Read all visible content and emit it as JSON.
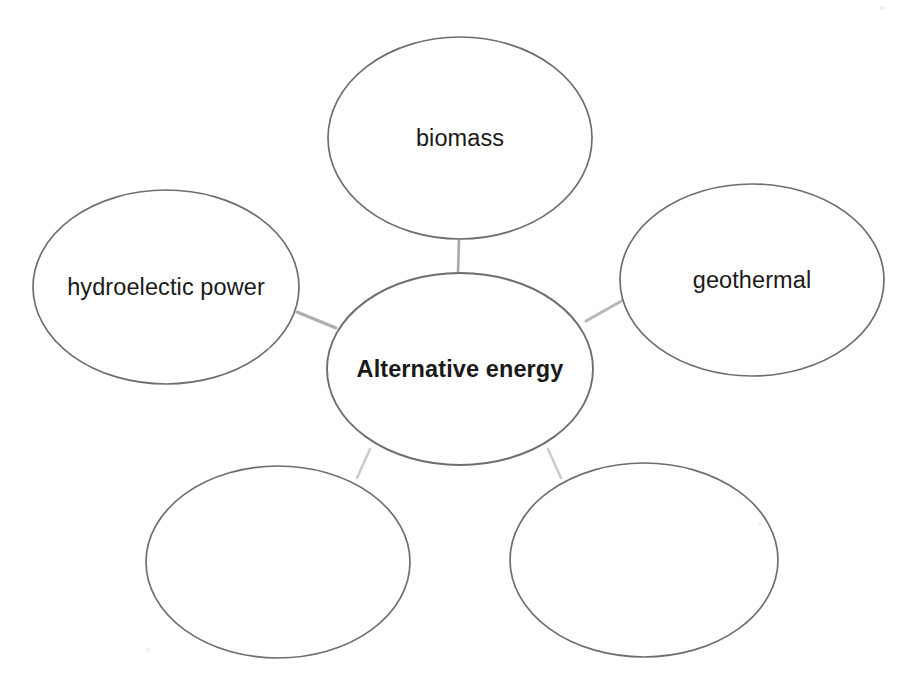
{
  "diagram": {
    "type": "concept-map",
    "title_text": "Alternative energy",
    "background_color": "#ffffff",
    "outline_color": "#6e6e6e",
    "connector_color": "#9a9a9a",
    "text_color": "#1a1a1a",
    "center_node": {
      "id": "center",
      "label": "Alternative energy",
      "bold": true,
      "cx": 460,
      "cy": 369,
      "rx": 133,
      "ry": 96,
      "filled": true
    },
    "branch_nodes": [
      {
        "id": "top",
        "label": "biomass",
        "bold": false,
        "cx": 460,
        "cy": 138,
        "rx": 132,
        "ry": 101,
        "filled": true
      },
      {
        "id": "left",
        "label": "hydroelectic power",
        "bold": false,
        "cx": 166,
        "cy": 287,
        "rx": 133,
        "ry": 97,
        "filled": true
      },
      {
        "id": "right",
        "label": "geothermal",
        "bold": false,
        "cx": 752,
        "cy": 280,
        "rx": 132,
        "ry": 96,
        "filled": true
      },
      {
        "id": "bottom-left",
        "label": "",
        "bold": false,
        "cx": 278,
        "cy": 562,
        "rx": 132,
        "ry": 96,
        "filled": false
      },
      {
        "id": "bottom-right",
        "label": "",
        "bold": false,
        "cx": 644,
        "cy": 560,
        "rx": 134,
        "ry": 97,
        "filled": false
      }
    ],
    "connectors": [
      {
        "id": "center-to-top",
        "from": "center",
        "to": "top",
        "x1": 458,
        "y1": 273,
        "x2": 459,
        "y2": 239,
        "width": 2.6,
        "opacity": 0.85
      },
      {
        "id": "center-to-left",
        "from": "center",
        "to": "left",
        "x1": 336,
        "y1": 328,
        "x2": 297,
        "y2": 312,
        "width": 3.0,
        "opacity": 0.8
      },
      {
        "id": "center-to-right",
        "from": "center",
        "to": "right",
        "x1": 586,
        "y1": 321,
        "x2": 625,
        "y2": 299,
        "width": 3.0,
        "opacity": 0.7
      },
      {
        "id": "center-to-bottom-left",
        "from": "center",
        "to": "bottom-left",
        "x1": 370,
        "y1": 449,
        "x2": 357,
        "y2": 478,
        "width": 2.6,
        "opacity": 0.5
      },
      {
        "id": "center-to-bottom-right",
        "from": "center",
        "to": "bottom-right",
        "x1": 548,
        "y1": 449,
        "x2": 561,
        "y2": 478,
        "width": 2.6,
        "opacity": 0.5
      }
    ],
    "specks": [
      {
        "x": 268,
        "y": 347,
        "size": 3
      },
      {
        "x": 758,
        "y": 522,
        "size": 3
      },
      {
        "x": 146,
        "y": 648,
        "size": 3
      },
      {
        "x": 880,
        "y": 6,
        "size": 4
      }
    ]
  }
}
